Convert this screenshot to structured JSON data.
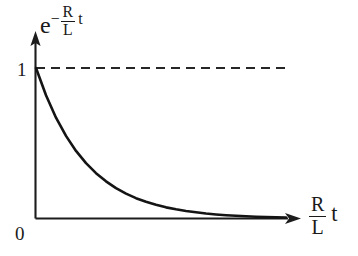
{
  "figure": {
    "background_color": "#ffffff",
    "ink_color": "#1a1a1a",
    "y_axis": {
      "label_base": "e",
      "label_exponent_minus": "−",
      "label_exponent_numerator": "R",
      "label_exponent_denominator": "L",
      "label_exponent_variable": "t",
      "tick_top": "1",
      "tick_origin": "0"
    },
    "x_axis": {
      "label_numerator": "R",
      "label_denominator": "L",
      "label_variable": "t"
    }
  },
  "chart_data": {
    "type": "line",
    "title": "",
    "xlabel": "(R/L)t",
    "ylabel": "e^(-(R/L)t)",
    "xlim": [
      0,
      5.2
    ],
    "ylim": [
      0,
      1.18
    ],
    "grid": false,
    "legend": null,
    "tick_labels": {
      "x": [
        "0"
      ],
      "y": [
        "0",
        "1"
      ]
    },
    "annotations": [
      {
        "kind": "asymptote",
        "text": "",
        "style": "dashed",
        "y_value": 1.0,
        "x_from": 0.0,
        "x_to": 5.0
      }
    ],
    "series": [
      {
        "name": "e^(-(R/L)t)",
        "style": "solid",
        "x": [
          0.0,
          0.2,
          0.4,
          0.6,
          0.8,
          1.0,
          1.2,
          1.4,
          1.6,
          1.8,
          2.0,
          2.2,
          2.4,
          2.6,
          2.8,
          3.0,
          3.2,
          3.4,
          3.6,
          3.8,
          4.0,
          4.2,
          4.4,
          4.6,
          4.8,
          5.0
        ],
        "y": [
          1.0,
          0.819,
          0.67,
          0.549,
          0.449,
          0.368,
          0.301,
          0.247,
          0.202,
          0.165,
          0.135,
          0.111,
          0.091,
          0.074,
          0.061,
          0.05,
          0.041,
          0.033,
          0.027,
          0.022,
          0.018,
          0.015,
          0.012,
          0.01,
          0.008,
          0.007
        ]
      }
    ]
  }
}
